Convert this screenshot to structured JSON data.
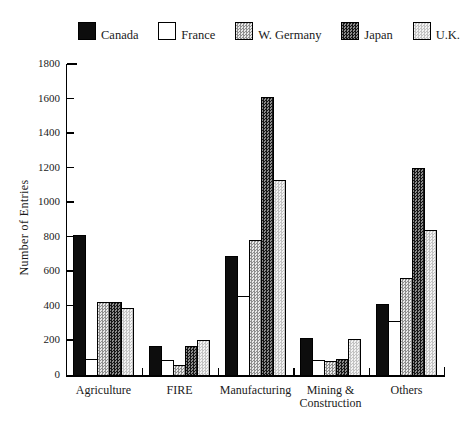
{
  "figure": {
    "background": "#ffffff"
  },
  "chart_data": {
    "type": "bar",
    "title": "",
    "xlabel": "",
    "ylabel": "Number of Entries",
    "ylim": [
      0,
      1800
    ],
    "ytick_step": 200,
    "ytick_labels": [
      "0",
      "200",
      "400",
      "600",
      "800",
      "1000",
      "1200",
      "1400",
      "1600",
      "1800"
    ],
    "grid": false,
    "legend_position": "top",
    "axis_color": "#000000",
    "bar_outline_color": "#000000",
    "categories": [
      "Agriculture",
      "FIRE",
      "Manufacturing",
      "Mining &\nConstruction",
      "Others"
    ],
    "series": [
      {
        "name": "Canada",
        "pattern": "solid-black",
        "color": "#0d0d0d",
        "values": [
          810,
          170,
          690,
          215,
          410
        ]
      },
      {
        "name": "France",
        "pattern": "plain-white",
        "color": "#ffffff",
        "values": [
          90,
          85,
          460,
          85,
          310
        ]
      },
      {
        "name": "W. Germany",
        "pattern": "medium-checker",
        "color": "#c4c4c4",
        "values": [
          420,
          60,
          780,
          80,
          560
        ]
      },
      {
        "name": "Japan",
        "pattern": "dark-checker",
        "color": "#565656",
        "values": [
          420,
          165,
          1610,
          95,
          1200
        ]
      },
      {
        "name": "U.K.",
        "pattern": "light-checker",
        "color": "#e2e2e2",
        "values": [
          390,
          205,
          1130,
          210,
          840
        ]
      }
    ]
  }
}
